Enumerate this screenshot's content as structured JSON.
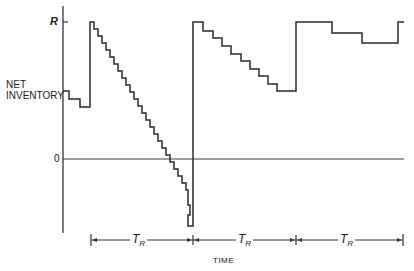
{
  "diagram": {
    "type": "inventory-sawtooth",
    "y_axis_label_line1": "NET",
    "y_axis_label_line2": "INVENTORY",
    "y_tick_top": "R",
    "y_tick_zero": "0",
    "x_axis_label": "TIME",
    "period_symbol": "T",
    "period_subscript": "R",
    "periods": [
      {
        "label": "T_R",
        "start_x": 91,
        "end_x": 193
      },
      {
        "label": "T_R",
        "start_x": 193,
        "end_x": 296
      },
      {
        "label": "T_R",
        "start_x": 296,
        "end_x": 403
      }
    ],
    "colors": {
      "line": "#2a2a2a",
      "axis": "#333333",
      "background": "#ffffff"
    }
  }
}
